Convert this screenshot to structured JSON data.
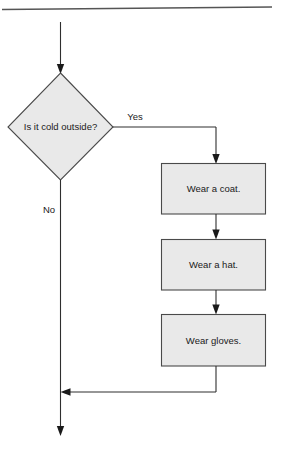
{
  "diagram": {
    "type": "flowchart",
    "title_rule": "horizontal-divider",
    "background_color": "#ffffff",
    "shape_fill_color": "#e9e9e9",
    "shape_border_color": "#4a4a4a",
    "connector_color": "#2e2e2e",
    "text_color": "#1a1a1a",
    "decision": {
      "label": "Is it cold outside?",
      "shape": "diamond"
    },
    "branch_labels": {
      "yes": "Yes",
      "no": "No"
    },
    "process_steps": [
      {
        "label": "Wear a coat."
      },
      {
        "label": "Wear a hat."
      },
      {
        "label": "Wear gloves."
      }
    ]
  }
}
